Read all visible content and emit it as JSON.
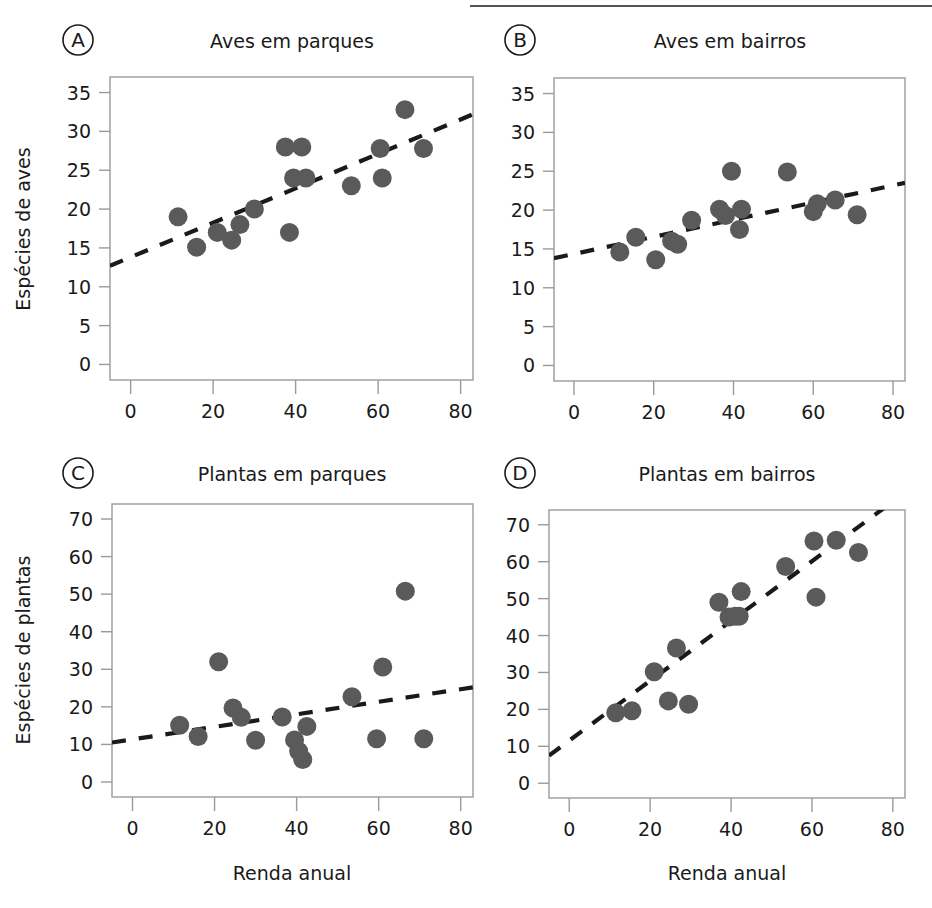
{
  "figure": {
    "width": 932,
    "height": 908,
    "background": "#ffffff",
    "header_rule": {
      "present": true,
      "x1": 470,
      "x2": 932,
      "y": 6,
      "color": "#555555"
    },
    "marker_color": "#5a5a5a",
    "trendline_color": "#1a1a1a",
    "frame_color": "#9a9a9a",
    "text_color": "#1a1a1a",
    "shared_xlabel": "Renda anual",
    "panel_label_style": "circled-letter"
  },
  "chart_data": [
    {
      "type": "scatter",
      "panel": "A",
      "panel_label": "A",
      "title": "Aves em parques",
      "xlabel": "",
      "ylabel": "Espécies de aves",
      "xlim": [
        -5,
        83
      ],
      "ylim": [
        -2,
        37
      ],
      "xticks": [
        0,
        20,
        40,
        60,
        80
      ],
      "yticks": [
        0,
        5,
        10,
        15,
        20,
        25,
        30,
        35
      ],
      "grid": false,
      "legend": null,
      "x": [
        11.5,
        16,
        21,
        24.5,
        26.5,
        30,
        37.5,
        38.5,
        39.5,
        41.5,
        42.5,
        53.5,
        60.5,
        61,
        66.5,
        71
      ],
      "y": [
        19,
        15.1,
        17,
        16,
        18,
        20,
        28,
        17,
        24,
        28,
        24,
        23,
        27.8,
        24,
        32.8,
        27.8
      ],
      "trendline": {
        "type": "dashed",
        "x1": -5,
        "y1": 12.7,
        "x2": 83,
        "y2": 32.2
      }
    },
    {
      "type": "scatter",
      "panel": "B",
      "panel_label": "B",
      "title": "Aves em bairros",
      "xlabel": "",
      "ylabel": "",
      "xlim": [
        -5,
        83
      ],
      "ylim": [
        -2,
        37
      ],
      "xticks": [
        0,
        20,
        40,
        60,
        80
      ],
      "yticks": [
        0,
        5,
        10,
        15,
        20,
        25,
        30,
        35
      ],
      "grid": false,
      "legend": null,
      "x": [
        11.5,
        15.5,
        20.5,
        24.5,
        26,
        29.5,
        36.5,
        38,
        39.5,
        41.5,
        42,
        53.5,
        60,
        61,
        65.5,
        71
      ],
      "y": [
        14.6,
        16.5,
        13.6,
        16,
        15.6,
        18.7,
        20.1,
        19.3,
        25,
        17.5,
        20.1,
        24.9,
        19.8,
        20.8,
        21.3,
        19.4
      ],
      "trendline": {
        "type": "dashed",
        "x1": -5,
        "y1": 13.8,
        "x2": 83,
        "y2": 23.5
      }
    },
    {
      "type": "scatter",
      "panel": "C",
      "panel_label": "C",
      "title": "Plantas em parques",
      "xlabel": "Renda anual",
      "ylabel": "Espécies de plantas",
      "xlim": [
        -5,
        83
      ],
      "ylim": [
        -4,
        74
      ],
      "xticks": [
        0,
        20,
        40,
        60,
        80
      ],
      "yticks": [
        0,
        10,
        20,
        30,
        40,
        50,
        60,
        70
      ],
      "grid": false,
      "legend": null,
      "x": [
        11.5,
        16,
        21,
        24.5,
        26.5,
        30,
        36.5,
        39.5,
        40.5,
        41.5,
        42.5,
        53.5,
        59.5,
        61,
        66.5,
        71
      ],
      "y": [
        15.1,
        12.1,
        32,
        19.7,
        17.2,
        11.1,
        17.3,
        11.2,
        8.2,
        6,
        14.8,
        22.7,
        11.5,
        30.6,
        50.8,
        11.5
      ],
      "trendline": {
        "type": "dashed",
        "x1": -5,
        "y1": 10.5,
        "x2": 83,
        "y2": 25.2
      }
    },
    {
      "type": "scatter",
      "panel": "D",
      "panel_label": "D",
      "title": "Plantas em bairros",
      "xlabel": "Renda anual",
      "ylabel": "",
      "xlim": [
        -5,
        83
      ],
      "ylim": [
        -4,
        74
      ],
      "xticks": [
        0,
        20,
        40,
        60,
        80
      ],
      "yticks": [
        0,
        10,
        20,
        30,
        40,
        50,
        60,
        70
      ],
      "grid": false,
      "legend": null,
      "x": [
        11.5,
        15.5,
        21,
        24.5,
        26.5,
        29.5,
        37,
        39.5,
        41,
        42,
        42.5,
        53.5,
        60.5,
        61,
        66,
        71.5
      ],
      "y": [
        19.1,
        19.6,
        30.2,
        22.3,
        36.6,
        21.4,
        49,
        45,
        45.2,
        45.2,
        51.9,
        58.7,
        65.6,
        50.4,
        65.8,
        62.5
      ],
      "trendline": {
        "type": "dashed",
        "x1": -5,
        "y1": 7.5,
        "x2": 79,
        "y2": 75.5
      }
    }
  ]
}
